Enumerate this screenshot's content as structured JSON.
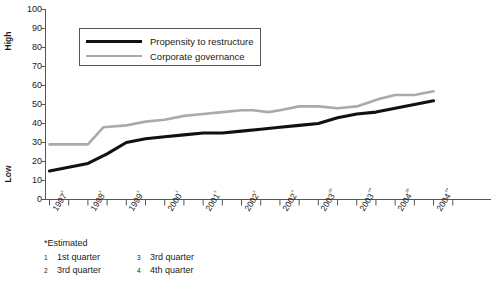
{
  "chart_data": {
    "type": "line",
    "title": "",
    "xlabel": "",
    "ylabel": "",
    "ylim": [
      0,
      100
    ],
    "ytick_labels": [
      "100",
      "90",
      "80",
      "70",
      "60",
      "50",
      "40",
      "30",
      "20",
      "10",
      "0"
    ],
    "ytick_values": [
      100,
      90,
      80,
      70,
      60,
      50,
      40,
      30,
      20,
      10,
      0
    ],
    "y_axis_high_label": "High",
    "y_axis_low_label": "Low",
    "grid": false,
    "legend_position": "upper-left-inside",
    "categories": [
      "1997¹",
      "1998¹",
      "1999¹",
      "2000¹",
      "2001¹",
      "2002¹",
      "2002⁴",
      "2003²*",
      "2003⁴*",
      "2004²*",
      "2004⁴*"
    ],
    "x": [
      0,
      1,
      2,
      3,
      4,
      5,
      6,
      7,
      8,
      9,
      10
    ],
    "series": [
      {
        "name": "Propensity to restructure",
        "color": "#111111",
        "values": [
          15,
          19,
          30,
          33,
          35,
          36,
          38,
          40,
          45,
          48,
          52
        ]
      },
      {
        "name": "Corporate governance",
        "color": "#aaaaaa",
        "values": [
          29,
          29,
          39,
          42,
          45,
          47,
          47,
          49,
          49,
          55,
          57
        ]
      }
    ],
    "series_detail_points": {
      "propensity_to_restructure": [
        {
          "x": 0.0,
          "y": 15
        },
        {
          "x": 0.5,
          "y": 17
        },
        {
          "x": 1.0,
          "y": 19
        },
        {
          "x": 1.5,
          "y": 24
        },
        {
          "x": 2.0,
          "y": 30
        },
        {
          "x": 2.5,
          "y": 32
        },
        {
          "x": 3.0,
          "y": 33
        },
        {
          "x": 3.5,
          "y": 34
        },
        {
          "x": 4.0,
          "y": 35
        },
        {
          "x": 4.5,
          "y": 35
        },
        {
          "x": 5.0,
          "y": 36
        },
        {
          "x": 5.5,
          "y": 37
        },
        {
          "x": 6.0,
          "y": 38
        },
        {
          "x": 6.5,
          "y": 39
        },
        {
          "x": 7.0,
          "y": 40
        },
        {
          "x": 7.5,
          "y": 43
        },
        {
          "x": 8.0,
          "y": 45
        },
        {
          "x": 8.5,
          "y": 46
        },
        {
          "x": 9.0,
          "y": 48
        },
        {
          "x": 9.5,
          "y": 50
        },
        {
          "x": 10.0,
          "y": 52
        }
      ],
      "corporate_governance": [
        {
          "x": 0.0,
          "y": 29
        },
        {
          "x": 0.5,
          "y": 29
        },
        {
          "x": 1.0,
          "y": 29
        },
        {
          "x": 1.4,
          "y": 38
        },
        {
          "x": 2.0,
          "y": 39
        },
        {
          "x": 2.5,
          "y": 41
        },
        {
          "x": 3.0,
          "y": 42
        },
        {
          "x": 3.5,
          "y": 44
        },
        {
          "x": 4.0,
          "y": 45
        },
        {
          "x": 4.5,
          "y": 46
        },
        {
          "x": 5.0,
          "y": 47
        },
        {
          "x": 5.3,
          "y": 47
        },
        {
          "x": 5.7,
          "y": 46
        },
        {
          "x": 6.0,
          "y": 47
        },
        {
          "x": 6.5,
          "y": 49
        },
        {
          "x": 7.0,
          "y": 49
        },
        {
          "x": 7.5,
          "y": 48
        },
        {
          "x": 8.0,
          "y": 49
        },
        {
          "x": 8.6,
          "y": 53
        },
        {
          "x": 9.0,
          "y": 55
        },
        {
          "x": 9.5,
          "y": 55
        },
        {
          "x": 10.0,
          "y": 57
        }
      ]
    },
    "annotations": {
      "estimated_note": "*Estimated",
      "footnote_markers": [
        "1",
        "2",
        "3",
        "4"
      ],
      "footnote_texts": [
        "1st quarter",
        "3rd quarter",
        "3rd quarter",
        "4th quarter"
      ]
    }
  },
  "legend": {
    "entries": [
      {
        "label": "Propensity to restructure",
        "color": "#111111"
      },
      {
        "label": "Corporate governance",
        "color": "#aaaaaa"
      }
    ]
  },
  "footnotes": {
    "estimated": "*Estimated",
    "rows": [
      {
        "marker_left": "1",
        "text_left": "1st quarter",
        "marker_right": "3",
        "text_right": "3rd quarter"
      },
      {
        "marker_left": "2",
        "text_left": "3rd quarter",
        "marker_right": "4",
        "text_right": "4th quarter"
      }
    ]
  },
  "colors": {
    "series_black": "#111111",
    "series_gray": "#aaaaaa",
    "axis": "#555555",
    "text": "#1a1a1a",
    "background": "#ffffff"
  }
}
